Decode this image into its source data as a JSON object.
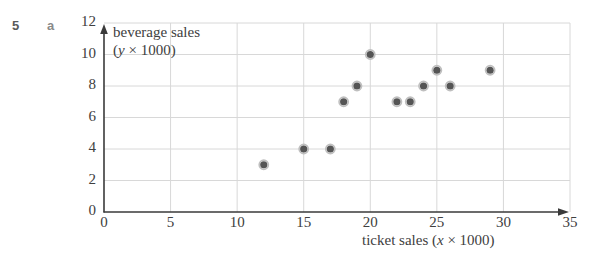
{
  "exercise": {
    "number": "5",
    "part": "a"
  },
  "chart_data": {
    "type": "scatter",
    "title": "",
    "xlabel": "ticket sales ($x × 1000)",
    "ylabel": "beverage sales ($y × 1000)",
    "xlabel_prefix": "ticket sales (",
    "xlabel_var": "x",
    "xlabel_suffix": " × 1000)",
    "ylabel_line1": "beverage sales",
    "ylabel_line2_prefix": "(",
    "ylabel_line2_var": "y",
    "ylabel_line2_suffix": " × 1000)",
    "xlim": [
      0,
      35
    ],
    "ylim": [
      0,
      12
    ],
    "xticks": [
      0,
      5,
      10,
      15,
      20,
      25,
      30,
      35
    ],
    "yticks": [
      0,
      2,
      4,
      6,
      8,
      10,
      12
    ],
    "xticklabels": [
      "0",
      "5",
      "10",
      "15",
      "20",
      "25",
      "30",
      "35"
    ],
    "yticklabels": [
      "0",
      "2",
      "4",
      "6",
      "8",
      "10",
      "12"
    ],
    "grid": true,
    "legend": false,
    "x": [
      12,
      15,
      17,
      18,
      19,
      20,
      22,
      23,
      24,
      25,
      26,
      29
    ],
    "y": [
      3,
      4,
      4,
      7,
      8,
      10,
      7,
      7,
      8,
      9,
      8,
      9
    ],
    "points": [
      {
        "x": 12,
        "y": 3
      },
      {
        "x": 15,
        "y": 4
      },
      {
        "x": 17,
        "y": 4
      },
      {
        "x": 18,
        "y": 7
      },
      {
        "x": 19,
        "y": 8
      },
      {
        "x": 20,
        "y": 10
      },
      {
        "x": 22,
        "y": 7
      },
      {
        "x": 23,
        "y": 7
      },
      {
        "x": 24,
        "y": 8
      },
      {
        "x": 25,
        "y": 9
      },
      {
        "x": 26,
        "y": 8
      },
      {
        "x": 29,
        "y": 9
      }
    ],
    "marker_fill": "#555555",
    "marker_ring": "#bfbfbf",
    "grid_color": "#d8d8d8",
    "axis_color": "#3a3a3a"
  }
}
